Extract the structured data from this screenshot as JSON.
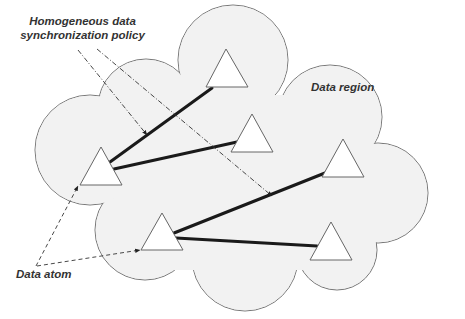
{
  "diagram": {
    "labels": {
      "policy_line1": "Homogeneous data",
      "policy_line2": "synchronization policy",
      "region": "Data region",
      "atom": "Data atom"
    },
    "colors": {
      "cloud_fill": "#f2f2f2",
      "cloud_stroke": "#777777",
      "link_stroke": "#1a1a1a",
      "triangle_fill": "#ffffff",
      "triangle_stroke": "#666666",
      "text": "#333333"
    },
    "nodes": [
      {
        "id": "atom-1",
        "cx": 100,
        "cy": 165
      },
      {
        "id": "atom-2",
        "cx": 222,
        "cy": 33
      },
      {
        "id": "atom-3",
        "cx": 252,
        "cy": 127
      },
      {
        "id": "atom-4",
        "cx": 343,
        "cy": 160
      },
      {
        "id": "atom-5",
        "cx": 162,
        "cy": 225
      },
      {
        "id": "atom-6",
        "cx": 331,
        "cy": 238
      }
    ],
    "links": [
      {
        "from": "atom-1",
        "to": "atom-2"
      },
      {
        "from": "atom-1",
        "to": "atom-3"
      },
      {
        "from": "atom-5",
        "to": "atom-4"
      },
      {
        "from": "atom-5",
        "to": "atom-6"
      }
    ]
  }
}
